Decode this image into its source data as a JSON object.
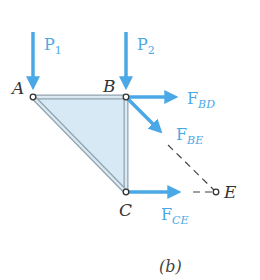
{
  "figure": {
    "caption": "(b)",
    "colors": {
      "force": "#4aa8e6",
      "member_fill": "#d6e9f5",
      "member_edge": "#8fa3b0",
      "joint_label": "#333333",
      "dashed_line": "#444444"
    },
    "joints": [
      {
        "id": "A",
        "label": "A"
      },
      {
        "id": "B",
        "label": "B"
      },
      {
        "id": "C",
        "label": "C"
      },
      {
        "id": "E",
        "label": "E"
      }
    ],
    "forces": [
      {
        "id": "P1",
        "main": "P",
        "sub": "1",
        "direction": "down",
        "at": "A"
      },
      {
        "id": "P2",
        "main": "P",
        "sub": "2",
        "direction": "down",
        "at": "B"
      },
      {
        "id": "FBD",
        "main": "F",
        "sub": "BD",
        "direction": "right",
        "at": "B"
      },
      {
        "id": "FBE",
        "main": "F",
        "sub": "BE",
        "direction": "down-right",
        "at": "B"
      },
      {
        "id": "FCE",
        "main": "F",
        "sub": "CE",
        "direction": "right",
        "at": "C"
      }
    ]
  }
}
